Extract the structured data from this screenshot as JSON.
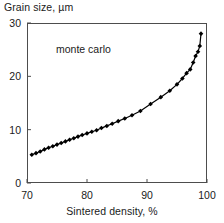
{
  "chart_data": {
    "type": "line",
    "title": "",
    "ylabel": "Grain size, µm",
    "xlabel": "Sintered density, %",
    "xlim": [
      70,
      100
    ],
    "ylim": [
      0,
      30
    ],
    "xticks": [
      70,
      80,
      90,
      100
    ],
    "yticks": [
      0,
      10,
      20,
      30
    ],
    "xtick_labels": [
      "70",
      "80",
      "90",
      "100"
    ],
    "ytick_labels": [
      "0",
      "10",
      "20",
      "30"
    ],
    "grid": false,
    "legend": null,
    "annotations": [
      {
        "text": "monte carlo",
        "x": 79.5,
        "y": 25.2
      }
    ],
    "series": [
      {
        "name": "monte carlo",
        "marker": "diamond",
        "line_color": "#000000",
        "marker_color": "#000000",
        "x": [
          70.8,
          71.5,
          72.2,
          72.9,
          73.6,
          74.3,
          75.0,
          75.7,
          76.4,
          77.1,
          77.8,
          78.5,
          79.2,
          80.0,
          80.8,
          81.6,
          82.4,
          83.3,
          84.2,
          85.2,
          86.3,
          87.5,
          88.9,
          90.6,
          92.3,
          93.8,
          95.0,
          95.9,
          96.6,
          97.2,
          97.7,
          98.1,
          98.5,
          98.8,
          99.0
        ],
        "y": [
          5.3,
          5.6,
          5.9,
          6.3,
          6.6,
          6.9,
          7.2,
          7.5,
          7.8,
          8.1,
          8.4,
          8.7,
          9.0,
          9.3,
          9.6,
          9.9,
          10.3,
          10.7,
          11.1,
          11.6,
          12.1,
          12.7,
          13.5,
          14.8,
          16.1,
          17.3,
          18.5,
          19.6,
          20.6,
          21.3,
          22.6,
          23.8,
          24.6,
          25.7,
          28.0
        ]
      }
    ]
  },
  "axis_style": {
    "frame_color": "#4d4d4d",
    "tick_color": "#4d4d4d",
    "text_color": "#1a1a1a"
  }
}
